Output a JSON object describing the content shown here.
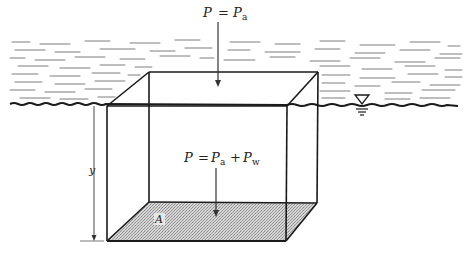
{
  "diagram": {
    "top_label": {
      "var": "P",
      "eq": "=",
      "term1": "P",
      "term1_sub": "a"
    },
    "bottom_label": {
      "var": "P",
      "eq": "=",
      "term1": "P",
      "term1_sub": "a",
      "plus": "+",
      "term2": "P",
      "term2_sub": "w"
    },
    "depth_label": "y",
    "area_label": "A",
    "water_surface_symbol": "free-surface-triangle",
    "colors": {
      "line": "#1a1a1a",
      "water_hatch": "#7a7a7a",
      "area_fill": "#c8c8c8",
      "background": "#ffffff"
    }
  }
}
